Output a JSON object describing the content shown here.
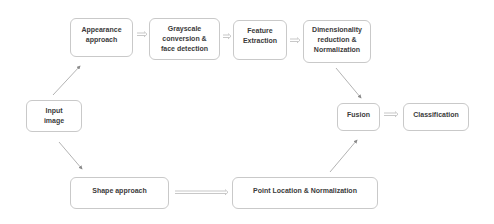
{
  "diagram": {
    "title": "",
    "nodes": {
      "input": {
        "lines": [
          "Input",
          "image"
        ]
      },
      "appearance": {
        "lines": [
          "Appearance",
          "approach"
        ]
      },
      "grayscale": {
        "lines": [
          "Grayscale",
          "conversion &",
          "face detection"
        ]
      },
      "feature": {
        "lines": [
          "Feature",
          "Extraction"
        ]
      },
      "dimensionality": {
        "lines": [
          "Dimensionality",
          "reduction &",
          "Normalization"
        ]
      },
      "fusion": {
        "lines": [
          "Fusion"
        ]
      },
      "classification": {
        "lines": [
          "Classification"
        ]
      },
      "shape": {
        "lines": [
          "Shape approach"
        ]
      },
      "point": {
        "lines": [
          "Point Location & Normalization"
        ]
      }
    },
    "edges": [
      {
        "from": "input",
        "to": "appearance",
        "style": "single-arrow"
      },
      {
        "from": "input",
        "to": "shape",
        "style": "single-arrow"
      },
      {
        "from": "appearance",
        "to": "grayscale",
        "style": "double-arrow"
      },
      {
        "from": "grayscale",
        "to": "feature",
        "style": "double-arrow"
      },
      {
        "from": "feature",
        "to": "dimensionality",
        "style": "double-arrow"
      },
      {
        "from": "dimensionality",
        "to": "fusion",
        "style": "single-arrow"
      },
      {
        "from": "shape",
        "to": "point",
        "style": "double-arrow"
      },
      {
        "from": "point",
        "to": "fusion",
        "style": "single-arrow"
      },
      {
        "from": "fusion",
        "to": "classification",
        "style": "double-arrow"
      }
    ],
    "colors": {
      "border": "#c9c9c9",
      "text": "#3b3b3b",
      "arrow": "#9a9a9a"
    }
  }
}
